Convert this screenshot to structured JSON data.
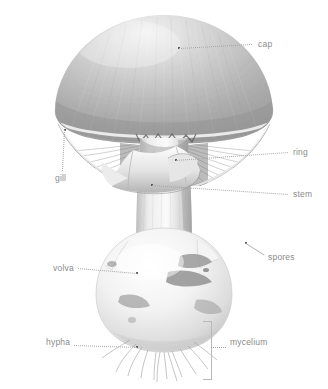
{
  "figure": {
    "style": "grayscale photographic illustration on white background",
    "background_color": "#ffffff",
    "label_color": "#8b8b8b",
    "leader_color": "#a6a6a6",
    "anchor_dot_color": "#2f2f2f"
  },
  "labels": [
    {
      "id": "cap",
      "text": "cap",
      "text_x": 258,
      "text_y": 44,
      "anchor_x": 179,
      "anchor_y": 48,
      "align": "left"
    },
    {
      "id": "gill",
      "text": "gill",
      "text_x": 55,
      "text_y": 178,
      "anchor_x": 65,
      "anchor_y": 130,
      "align": "left"
    },
    {
      "id": "ring",
      "text": "ring",
      "text_x": 293,
      "text_y": 152,
      "anchor_x": 176,
      "anchor_y": 160,
      "align": "left"
    },
    {
      "id": "stem",
      "text": "stem",
      "text_x": 293,
      "text_y": 194,
      "anchor_x": 152,
      "anchor_y": 185,
      "align": "left"
    },
    {
      "id": "spores",
      "text": "spores",
      "text_x": 268,
      "text_y": 257,
      "anchor_x": 246,
      "anchor_y": 243,
      "align": "left"
    },
    {
      "id": "volva",
      "text": "volva",
      "text_x": 53,
      "text_y": 268,
      "anchor_x": 137,
      "anchor_y": 273,
      "align": "left"
    },
    {
      "id": "hypha",
      "text": "hypha",
      "text_x": 46,
      "text_y": 342,
      "anchor_x": 137,
      "anchor_y": 347,
      "align": "left"
    },
    {
      "id": "mycelium",
      "text": "mycelium",
      "text_x": 230,
      "text_y": 342,
      "anchor_x": 212,
      "anchor_y": 347,
      "align": "left"
    }
  ],
  "bracket": {
    "name": "mycelium-bracket",
    "x": 203,
    "y": 321,
    "width": 8,
    "height": 57
  }
}
